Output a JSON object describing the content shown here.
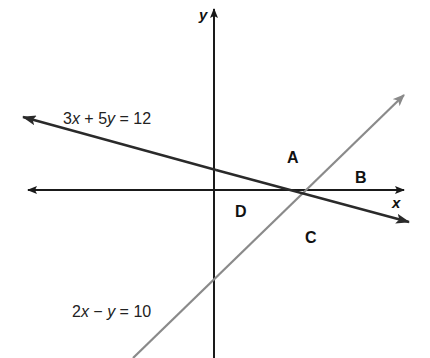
{
  "diagram": {
    "type": "coordinate-plane-system-of-inequalities",
    "axes": {
      "x_label": "x",
      "y_label": "y"
    },
    "lines": [
      {
        "name": "line-1",
        "equation": "3x + 5y = 12",
        "equation_parts": [
          "3",
          "x",
          " + 5",
          "y",
          " = 12"
        ],
        "color": "#2a2a2a"
      },
      {
        "name": "line-2",
        "equation": "2x − y = 10",
        "equation_parts": [
          "2",
          "x",
          " − ",
          "y",
          " = 10"
        ],
        "color": "#8a8a8a"
      }
    ],
    "regions": [
      {
        "label": "A"
      },
      {
        "label": "B"
      },
      {
        "label": "C"
      },
      {
        "label": "D"
      }
    ],
    "colors": {
      "axis": "#1a1a1a",
      "line_dark": "#2a2a2a",
      "line_gray": "#8a8a8a",
      "background": "#ffffff"
    }
  }
}
